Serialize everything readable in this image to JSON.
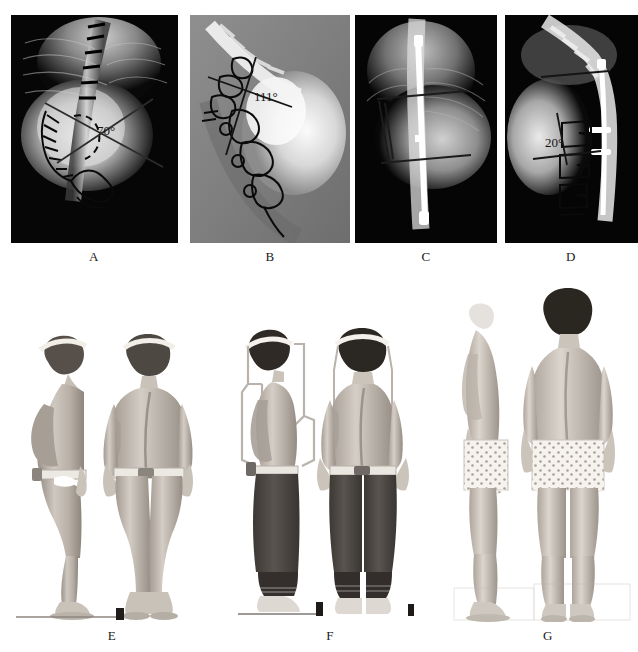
{
  "figure": {
    "kind": "medical-imaging-figure",
    "width": 638,
    "height": 652,
    "background": "#ffffff",
    "row1_label": "preoperative and postoperative radiographs",
    "row2_label": "clinical photographs"
  },
  "panels": [
    {
      "id": "A",
      "label": "A",
      "type": "radiograph",
      "view": "posteroanterior",
      "stage": "preoperative",
      "measurement": {
        "value": "70",
        "unit": "°",
        "text": "70°",
        "name": "cobb-angle"
      },
      "overlay": "vertebral endplate markers, traced rib and vertebral outlines, dashed arc, crossing Cobb lines",
      "rect": {
        "x": 11,
        "y": 15,
        "w": 167,
        "h": 228
      },
      "tone": "dark",
      "label_pos": {
        "x": 94,
        "y": 249
      }
    },
    {
      "id": "B",
      "label": "B",
      "type": "radiograph",
      "view": "lateral",
      "stage": "preoperative",
      "measurement": {
        "value": "111",
        "unit": "°",
        "text": "111°",
        "name": "kyphosis-angle"
      },
      "overlay": "hand-drawn vertebral body tracings with crossing angle lines",
      "rect": {
        "x": 190,
        "y": 15,
        "w": 160,
        "h": 228
      },
      "tone": "mid-gray",
      "label_pos": {
        "x": 270,
        "y": 249
      }
    },
    {
      "id": "C",
      "label": "C",
      "type": "radiograph",
      "view": "posteroanterior",
      "stage": "postoperative",
      "measurement": {
        "value": "",
        "unit": "",
        "text": "",
        "name": "none"
      },
      "overlay": "vertical instrumentation rod with two end-vertebra reference lines",
      "rect": {
        "x": 355,
        "y": 15,
        "w": 142,
        "h": 228
      },
      "tone": "dark",
      "label_pos": {
        "x": 426,
        "y": 249
      }
    },
    {
      "id": "D",
      "label": "D",
      "type": "radiograph",
      "view": "lateral",
      "stage": "postoperative",
      "measurement": {
        "value": "20",
        "unit": "°",
        "text": "20°",
        "name": "kyphosis-angle"
      },
      "overlay": "posterior rod with hooks, vertebral tracings and residual angle lines",
      "rect": {
        "x": 505,
        "y": 15,
        "w": 133,
        "h": 228
      },
      "tone": "dark",
      "label_pos": {
        "x": 571,
        "y": 249
      }
    },
    {
      "id": "E",
      "label": "E",
      "type": "clinical-photo",
      "stage": "preoperative",
      "views": [
        "lateral standing",
        "posterior standing"
      ],
      "notes": "eye band, pelvic band, severe rib hump, unclothed",
      "rect": {
        "x": 10,
        "y": 328,
        "w": 210,
        "h": 292
      },
      "label_pos": {
        "x": 112,
        "y": 628
      }
    },
    {
      "id": "F",
      "label": "F",
      "type": "clinical-photo",
      "stage": "in halo traction",
      "views": [
        "lateral standing",
        "posterior standing"
      ],
      "notes": "halo device, eye band, dark trousers, floor scale bar",
      "rect": {
        "x": 228,
        "y": 322,
        "w": 206,
        "h": 298
      },
      "label_pos": {
        "x": 330,
        "y": 628
      }
    },
    {
      "id": "G",
      "label": "G",
      "type": "clinical-photo",
      "stage": "postoperative",
      "views": [
        "lateral standing",
        "posterior standing"
      ],
      "notes": "improved trunk balance, patterned shorts, no head band",
      "rect": {
        "x": 448,
        "y": 290,
        "w": 186,
        "h": 330
      },
      "label_pos": {
        "x": 548,
        "y": 628
      }
    }
  ],
  "colors": {
    "page_bg": "#ffffff",
    "xray_black": "#050505",
    "xray_gray": "#8a8a8a",
    "bone_white": "#f2f2f2",
    "ink": "#111111",
    "label_text": "#1a1a1a",
    "skin_light": "#d8d2cb",
    "skin_mid": "#b3aba2",
    "skin_dark": "#8d857c",
    "hair": "#2a2520",
    "trousers": "#4a4540"
  }
}
